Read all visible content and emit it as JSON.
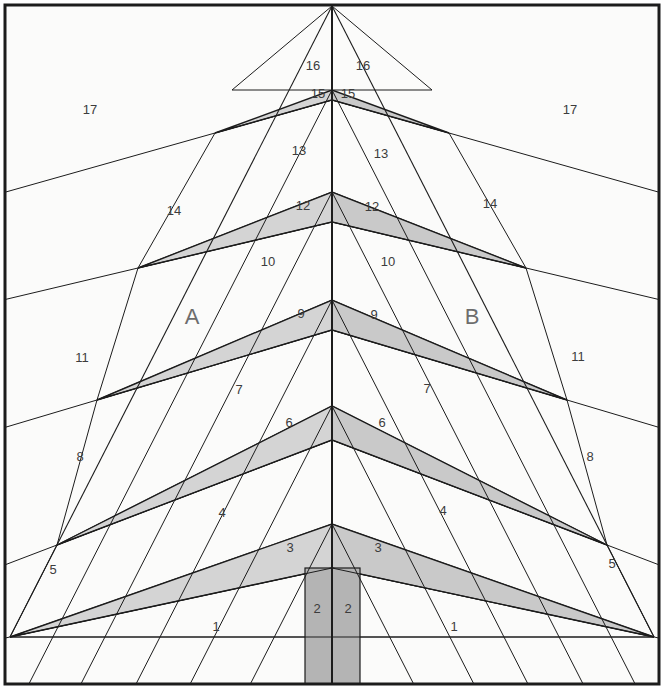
{
  "figure": {
    "background_color": "#fbfbfa",
    "frame_color": "#1c1c1c",
    "line_color": "#1c1c1c",
    "band_fill_light": "#d4d4d4",
    "band_fill_mid": "#c9c9c9",
    "column_fill": "#b4b4b4",
    "panel_fill": "#fbfbfa",
    "label_color": "#3c3c3c",
    "letter_color": "#6d6d6d"
  },
  "letters": [
    {
      "text": "A",
      "x": 192,
      "y": 318
    },
    {
      "text": "B",
      "x": 472,
      "y": 318
    }
  ],
  "numbers": [
    {
      "text": "16",
      "x": 313,
      "y": 67
    },
    {
      "text": "16",
      "x": 363,
      "y": 67
    },
    {
      "text": "15",
      "x": 318,
      "y": 95
    },
    {
      "text": "15",
      "x": 348,
      "y": 95
    },
    {
      "text": "17",
      "x": 90,
      "y": 111
    },
    {
      "text": "17",
      "x": 570,
      "y": 111
    },
    {
      "text": "13",
      "x": 299,
      "y": 152
    },
    {
      "text": "13",
      "x": 381,
      "y": 155
    },
    {
      "text": "12",
      "x": 303,
      "y": 207
    },
    {
      "text": "12",
      "x": 372,
      "y": 208
    },
    {
      "text": "14",
      "x": 174,
      "y": 212
    },
    {
      "text": "14",
      "x": 490,
      "y": 205
    },
    {
      "text": "10",
      "x": 268,
      "y": 263
    },
    {
      "text": "10",
      "x": 388,
      "y": 263
    },
    {
      "text": "9",
      "x": 301,
      "y": 315
    },
    {
      "text": "9",
      "x": 374,
      "y": 316
    },
    {
      "text": "11",
      "x": 82,
      "y": 359
    },
    {
      "text": "11",
      "x": 578,
      "y": 358
    },
    {
      "text": "7",
      "x": 239,
      "y": 391
    },
    {
      "text": "7",
      "x": 427,
      "y": 390
    },
    {
      "text": "6",
      "x": 289,
      "y": 424
    },
    {
      "text": "6",
      "x": 382,
      "y": 424
    },
    {
      "text": "8",
      "x": 80,
      "y": 458
    },
    {
      "text": "8",
      "x": 590,
      "y": 458
    },
    {
      "text": "4",
      "x": 222,
      "y": 514
    },
    {
      "text": "4",
      "x": 443,
      "y": 512
    },
    {
      "text": "3",
      "x": 290,
      "y": 549
    },
    {
      "text": "3",
      "x": 378,
      "y": 549
    },
    {
      "text": "5",
      "x": 53,
      "y": 571
    },
    {
      "text": "5",
      "x": 612,
      "y": 565
    },
    {
      "text": "2",
      "x": 317,
      "y": 610
    },
    {
      "text": "2",
      "x": 348,
      "y": 610
    },
    {
      "text": "1",
      "x": 216,
      "y": 628
    },
    {
      "text": "1",
      "x": 454,
      "y": 628
    }
  ],
  "geometry": {
    "apex": {
      "x": 332,
      "y": 6
    },
    "frame": {
      "x": 5,
      "y": 5,
      "width": 654,
      "height": 679
    },
    "axis": {
      "x": 332,
      "y1": 6,
      "y2": 684
    },
    "left_base": {
      "x": 10,
      "y": 637
    },
    "right_base": {
      "x": 654,
      "y": 637
    },
    "tiers": [
      {
        "level": 17,
        "band_top_y": 90,
        "band_bot_y": 100,
        "tip_x": 215,
        "tip_y": 133
      },
      {
        "level": 14,
        "band_top_y": 192,
        "band_bot_y": 222,
        "tip_x": 138,
        "tip_y": 268
      },
      {
        "level": 11,
        "band_top_y": 300,
        "band_bot_y": 330,
        "tip_x": 97,
        "tip_y": 400
      },
      {
        "level": 8,
        "band_top_y": 406,
        "band_bot_y": 440,
        "tip_x": 57,
        "tip_y": 545
      },
      {
        "level": 5,
        "band_top_y": 524,
        "band_bot_y": 568,
        "tip_x": 10,
        "tip_y": 637
      }
    ],
    "columns": [
      {
        "name": "left-column",
        "x": 305,
        "y": 568,
        "width": 27,
        "height": 116
      },
      {
        "name": "right-column",
        "x": 332,
        "y": 568,
        "width": 28,
        "height": 116
      }
    ]
  }
}
